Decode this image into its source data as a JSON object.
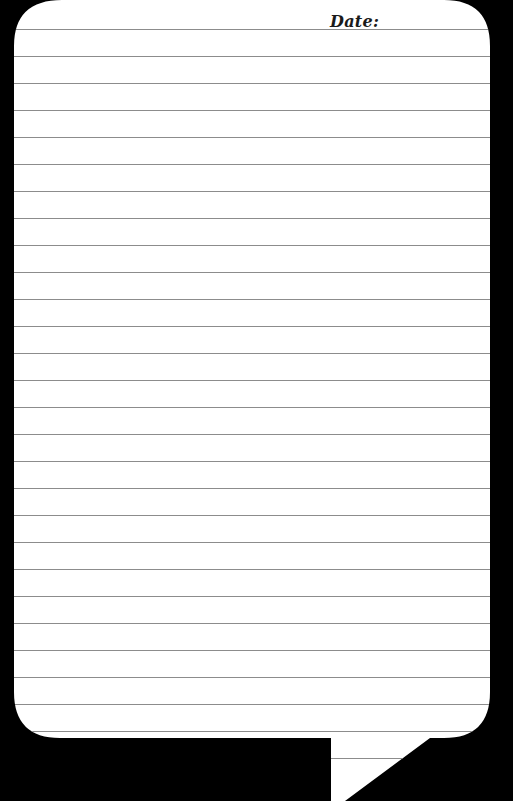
{
  "note": {
    "date_label": "Date:",
    "line_count": 28,
    "line_start_y": 29,
    "line_spacing": 27,
    "colors": {
      "background": "#000000",
      "paper": "#ffffff",
      "rule_line": "#8c8c8c",
      "text": "#1a1a1a"
    }
  }
}
